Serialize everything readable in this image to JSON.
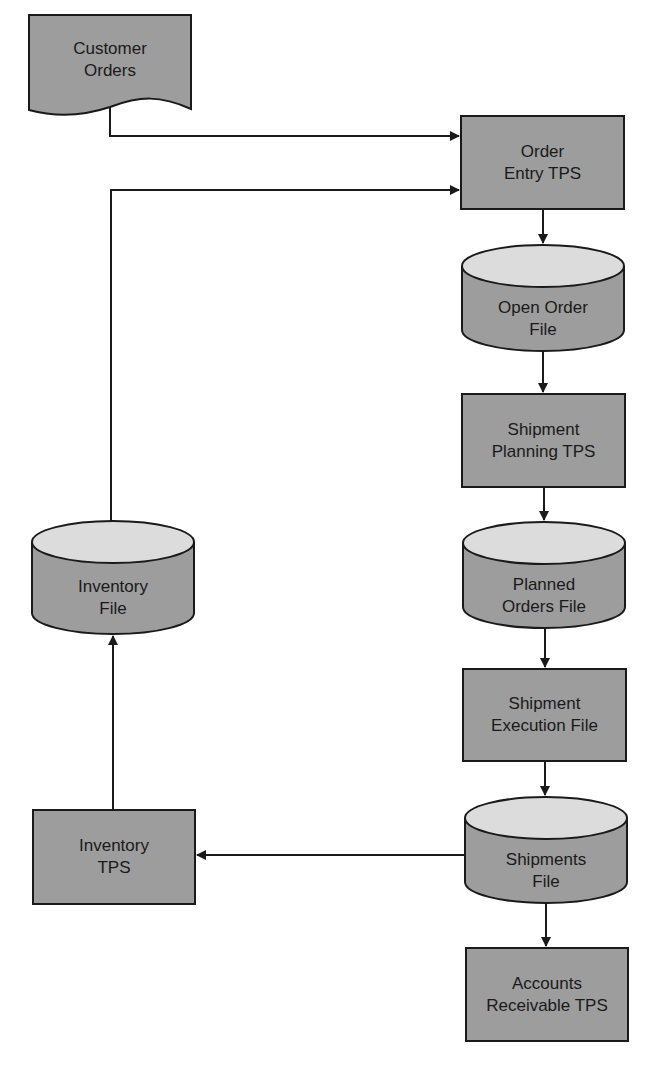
{
  "diagram": {
    "type": "data flow diagram",
    "colors": {
      "shape_fill": "#9d9d9d",
      "cylinder_top": "#dcdcdc",
      "stroke": "#1a1a1a",
      "background": "#ffffff"
    },
    "nodes": [
      {
        "id": "customer_orders",
        "shape": "document",
        "line1": "Customer",
        "line2": "Orders"
      },
      {
        "id": "order_entry_tps",
        "shape": "process",
        "line1": "Order",
        "line2": "Entry TPS"
      },
      {
        "id": "open_order_file",
        "shape": "datastore",
        "line1": "Open Order",
        "line2": "File"
      },
      {
        "id": "shipment_planning_tps",
        "shape": "process",
        "line1": "Shipment",
        "line2": "Planning TPS"
      },
      {
        "id": "planned_orders_file",
        "shape": "datastore",
        "line1": "Planned",
        "line2": "Orders File"
      },
      {
        "id": "shipment_execution_file",
        "shape": "process",
        "line1": "Shipment",
        "line2": "Execution File"
      },
      {
        "id": "shipments_file",
        "shape": "datastore",
        "line1": "Shipments",
        "line2": "File"
      },
      {
        "id": "accounts_receivable_tps",
        "shape": "process",
        "line1": "Accounts",
        "line2": "Receivable TPS"
      },
      {
        "id": "inventory_file",
        "shape": "datastore",
        "line1": "Inventory",
        "line2": "File"
      },
      {
        "id": "inventory_tps",
        "shape": "process",
        "line1": "Inventory",
        "line2": "TPS"
      }
    ],
    "edges": [
      {
        "from": "customer_orders",
        "to": "order_entry_tps"
      },
      {
        "from": "inventory_file",
        "to": "order_entry_tps"
      },
      {
        "from": "order_entry_tps",
        "to": "open_order_file"
      },
      {
        "from": "open_order_file",
        "to": "shipment_planning_tps"
      },
      {
        "from": "shipment_planning_tps",
        "to": "planned_orders_file"
      },
      {
        "from": "planned_orders_file",
        "to": "shipment_execution_file"
      },
      {
        "from": "shipment_execution_file",
        "to": "shipments_file"
      },
      {
        "from": "shipments_file",
        "to": "accounts_receivable_tps"
      },
      {
        "from": "shipments_file",
        "to": "inventory_tps"
      },
      {
        "from": "inventory_tps",
        "to": "inventory_file"
      }
    ]
  }
}
